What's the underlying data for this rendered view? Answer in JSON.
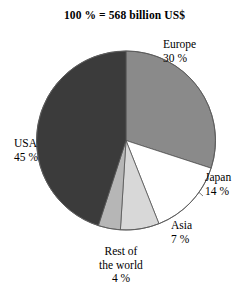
{
  "chart_data": {
    "type": "pie",
    "title": "100 % = 568 billion US$",
    "total_label": "100 %",
    "total_value": "568 billion US$",
    "xlabel": "",
    "ylabel": "",
    "legend_position": "outside-callouts",
    "grid": false,
    "start_angle_deg": 0,
    "direction": "clockwise",
    "categories": [
      "Europe",
      "Japan",
      "Asia",
      "Rest of the world",
      "USA"
    ],
    "values": [
      30,
      14,
      7,
      4,
      45
    ],
    "units": "percent",
    "slices": [
      {
        "name": "Europe",
        "label": "Europe",
        "value": 30,
        "value_label": "30 %",
        "color": "#8a8a8a",
        "start_deg": 0,
        "end_deg": 108
      },
      {
        "name": "Japan",
        "label": "Japan",
        "value": 14,
        "value_label": "14 %",
        "color": "#ffffff",
        "start_deg": 108,
        "end_deg": 158.4
      },
      {
        "name": "Asia",
        "label": "Asia",
        "value": 7,
        "value_label": "7 %",
        "color": "#d8d8d8",
        "start_deg": 158.4,
        "end_deg": 183.6
      },
      {
        "name": "Rest of the world",
        "label_line1": "Rest of",
        "label_line2": "the world",
        "value": 4,
        "value_label": "4 %",
        "color": "#b6b6b6",
        "start_deg": 183.6,
        "end_deg": 198
      },
      {
        "name": "USA",
        "label": "USA",
        "value": 45,
        "value_label": "45 %",
        "color": "#3b3b3b",
        "start_deg": 198,
        "end_deg": 360
      }
    ]
  },
  "colors": {
    "background": "#ffffff",
    "outline": "#555555",
    "text": "#000000",
    "europe": "#8a8a8a",
    "japan": "#ffffff",
    "asia": "#d8d8d8",
    "rest_of_world": "#b6b6b6",
    "usa": "#3b3b3b"
  }
}
